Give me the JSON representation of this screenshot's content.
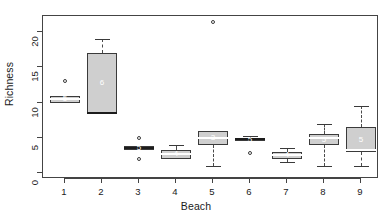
{
  "chart_data": {
    "type": "box",
    "title": "",
    "xlabel": "Beach",
    "ylabel": "Richness",
    "categories": [
      "1",
      "2",
      "3",
      "4",
      "5",
      "6",
      "7",
      "8",
      "9"
    ],
    "xtick_labels": [
      "1",
      "2",
      "3",
      "4",
      "5",
      "6",
      "7",
      "8",
      "9"
    ],
    "ytick_labels": [
      "0",
      "5",
      "10",
      "15",
      "20"
    ],
    "yticks": [
      0,
      5,
      10,
      15,
      20
    ],
    "ylim": [
      -0.6,
      22.5
    ],
    "grid": false,
    "legend": null,
    "box_fill": "#cfcfcf",
    "box_stroke": "#3a3a3a",
    "median_color": "#ffffff",
    "boxes": [
      {
        "category": "1",
        "n_label": "5",
        "lower_whisker": 10.0,
        "q1": 10.0,
        "median": 10.5,
        "q3": 11.0,
        "upper_whisker": 11.0,
        "outliers": [
          13.0
        ]
      },
      {
        "category": "2",
        "n_label": "6",
        "lower_whisker": 8.5,
        "q1": 8.5,
        "median": 8.5,
        "q3": 17.0,
        "upper_whisker": 19.0,
        "outliers": []
      },
      {
        "category": "3",
        "n_label": "5",
        "lower_whisker": 3.5,
        "q1": 3.2,
        "median": 3.5,
        "q3": 3.8,
        "upper_whisker": 3.8,
        "outliers": [
          5.0,
          2.0
        ]
      },
      {
        "category": "4",
        "n_label": "4",
        "lower_whisker": 2.0,
        "q1": 2.0,
        "median": 2.7,
        "q3": 3.3,
        "upper_whisker": 4.0,
        "outliers": []
      },
      {
        "category": "5",
        "n_label": "3",
        "lower_whisker": 1.0,
        "q1": 4.0,
        "median": 5.0,
        "q3": 6.0,
        "upper_whisker": 6.0,
        "outliers": [
          21.5
        ]
      },
      {
        "category": "6",
        "n_label": "5",
        "lower_whisker": 4.5,
        "q1": 4.5,
        "median": 4.8,
        "q3": 5.0,
        "upper_whisker": 5.2,
        "outliers": [
          2.8
        ]
      },
      {
        "category": "7",
        "n_label": "4",
        "lower_whisker": 1.5,
        "q1": 2.0,
        "median": 2.6,
        "q3": 3.0,
        "upper_whisker": 3.5,
        "outliers": []
      },
      {
        "category": "8",
        "n_label": "5",
        "lower_whisker": 1.0,
        "q1": 4.0,
        "median": 5.0,
        "q3": 5.5,
        "upper_whisker": 7.0,
        "outliers": []
      },
      {
        "category": "9",
        "n_label": "5",
        "lower_whisker": 1.0,
        "q1": 3.0,
        "median": 3.2,
        "q3": 6.5,
        "upper_whisker": 9.5,
        "outliers": []
      }
    ]
  }
}
